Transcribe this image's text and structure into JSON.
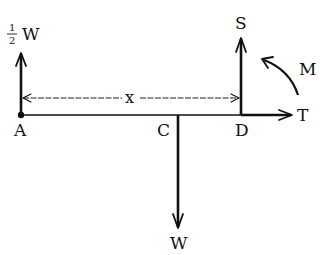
{
  "diagram": {
    "type": "free-body diagram of a horizontal beam",
    "points": {
      "A": "A",
      "C": "C",
      "D": "D"
    },
    "forces": {
      "half_weight": {
        "numerator": "1",
        "denominator": "2",
        "symbol": "W",
        "direction": "up",
        "at": "A"
      },
      "weight": {
        "symbol": "W",
        "direction": "down",
        "at": "C"
      },
      "shear": {
        "symbol": "S",
        "direction": "up",
        "at": "D"
      },
      "tension": {
        "symbol": "T",
        "direction": "right",
        "at": "D"
      },
      "moment": {
        "symbol": "M",
        "direction": "counter-clockwise",
        "at": "D"
      }
    },
    "dimension": {
      "label": "x",
      "from": "A",
      "to": "D"
    },
    "colors": {
      "ink": "#111111",
      "background": "#ffffff"
    }
  }
}
